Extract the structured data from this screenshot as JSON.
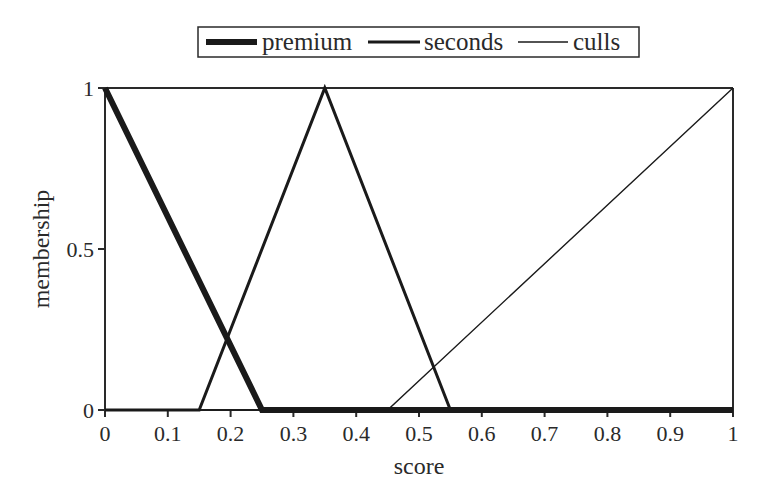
{
  "chart_data": {
    "type": "line",
    "title": "",
    "xlabel": "score",
    "ylabel": "membership",
    "xlim": [
      0,
      1
    ],
    "ylim": [
      0,
      1
    ],
    "grid": false,
    "legend_position": "top",
    "x_ticks": [
      "0",
      "0.1",
      "0.2",
      "0.3",
      "0.4",
      "0.5",
      "0.6",
      "0.7",
      "0.8",
      "0.9",
      "1"
    ],
    "y_ticks": [
      "0",
      "0.5",
      "1"
    ],
    "series": [
      {
        "name": "premium",
        "line_weight": "thick",
        "x": [
          0,
          0.25,
          1
        ],
        "y": [
          1,
          0,
          0
        ]
      },
      {
        "name": "seconds",
        "line_weight": "medium",
        "x": [
          0,
          0.15,
          0.35,
          0.55,
          1
        ],
        "y": [
          0,
          0,
          1,
          0,
          0
        ]
      },
      {
        "name": "culls",
        "line_weight": "thin",
        "x": [
          0,
          0.45,
          1
        ],
        "y": [
          0,
          0,
          1
        ]
      }
    ]
  },
  "legend": {
    "items": [
      {
        "label": "premium"
      },
      {
        "label": "seconds"
      },
      {
        "label": "culls"
      }
    ]
  },
  "axes": {
    "x_title": "score",
    "y_title": "membership"
  }
}
